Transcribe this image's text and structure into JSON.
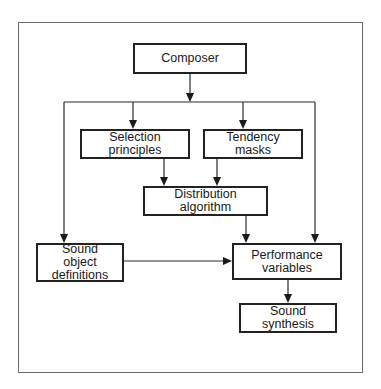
{
  "diagram": {
    "type": "flowchart",
    "nodes": [
      {
        "id": "composer",
        "label": "Composer"
      },
      {
        "id": "selection",
        "label": "Selection principles"
      },
      {
        "id": "tendency",
        "label": "Tendency masks"
      },
      {
        "id": "distribution",
        "label": "Distribution algorithm"
      },
      {
        "id": "sound_object",
        "label": "Sound object definitions"
      },
      {
        "id": "performance",
        "label": "Performance variables"
      },
      {
        "id": "synthesis",
        "label": "Sound synthesis"
      }
    ],
    "edges": [
      {
        "from": "composer",
        "to": "selection"
      },
      {
        "from": "composer",
        "to": "tendency"
      },
      {
        "from": "composer",
        "to": "sound_object"
      },
      {
        "from": "composer",
        "to": "performance"
      },
      {
        "from": "selection",
        "to": "distribution"
      },
      {
        "from": "tendency",
        "to": "distribution"
      },
      {
        "from": "distribution",
        "to": "performance"
      },
      {
        "from": "sound_object",
        "to": "performance"
      },
      {
        "from": "performance",
        "to": "synthesis"
      }
    ]
  },
  "labels": {
    "composer": "Composer",
    "selection": "Selection principles",
    "tendency": "Tendency masks",
    "distribution": "Distribution algorithm",
    "sound_object": "Sound object definitions",
    "performance": "Performance variables",
    "synthesis": "Sound synthesis"
  }
}
